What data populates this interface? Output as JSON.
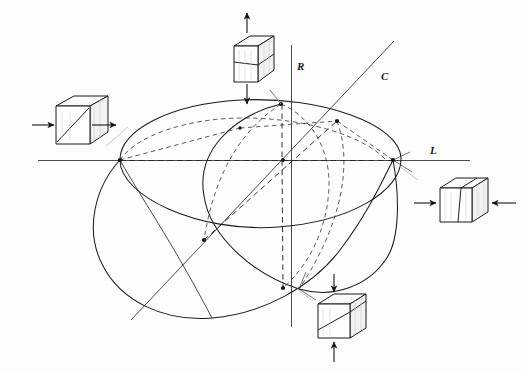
{
  "figure": {
    "background_color": "#fdfdfd",
    "ink_color": "#1b1b1b",
    "width": 521,
    "height": 372
  },
  "axes": [
    {
      "id": "R",
      "label": "R",
      "orientation": "vertical",
      "label_x": 297,
      "label_y": 66,
      "x1": 291,
      "y1": 45,
      "x2": 291,
      "y2": 327
    },
    {
      "id": "L",
      "label": "L",
      "orientation": "horizontal",
      "label_x": 432,
      "label_y": 152,
      "x1": 38,
      "y1": 160,
      "x2": 470,
      "y2": 160
    },
    {
      "id": "C",
      "label": "C",
      "orientation": "diagonal",
      "label_x": 383,
      "label_y": 78,
      "x1": 131,
      "y1": 320,
      "x2": 394,
      "y2": 41
    }
  ],
  "ellipsoid": {
    "center": {
      "x": 283,
      "y": 160
    },
    "sections": [
      {
        "name": "outline-ellipse",
        "style": "solid"
      },
      {
        "name": "front-great-circle",
        "style": "solid"
      },
      {
        "name": "lower-great-circle",
        "style": "solid"
      },
      {
        "name": "rear-great-circle",
        "style": "dashed"
      },
      {
        "name": "meridian-dashed",
        "style": "dashed"
      }
    ],
    "nodes": [
      {
        "name": "L-negative-pole",
        "x": 120,
        "y": 160
      },
      {
        "name": "L-positive-pole",
        "x": 393,
        "y": 160
      },
      {
        "name": "R-positive-pole",
        "x": 281,
        "y": 104
      },
      {
        "name": "R-negative-pole",
        "x": 283,
        "y": 288
      },
      {
        "name": "C-positive-pole",
        "x": 337,
        "y": 121
      },
      {
        "name": "C-negative-pole",
        "x": 204,
        "y": 240
      },
      {
        "name": "center",
        "x": 283,
        "y": 160
      }
    ]
  },
  "blocks": [
    {
      "id": "left-block",
      "data_name": "deformation-block-left",
      "position": {
        "x": 38,
        "y": 95
      },
      "marking": "diagonal-plane",
      "arrow_direction": "horizontal-outward",
      "stress_state": "extension",
      "linked_axis": "L",
      "leader": {
        "x1": 106,
        "y1": 146,
        "x2": 128,
        "y2": 127
      }
    },
    {
      "id": "top-block",
      "data_name": "deformation-block-top",
      "position": {
        "x": 228,
        "y": 33
      },
      "marking": "horizontal-plane",
      "arrow_direction": "vertical-outward",
      "stress_state": "extension",
      "linked_axis": "R",
      "leader": {
        "x1": 271,
        "y1": 88,
        "x2": 281,
        "y2": 104
      }
    },
    {
      "id": "right-block",
      "data_name": "deformation-block-right",
      "position": {
        "x": 432,
        "y": 178
      },
      "marking": "vertical-plane",
      "arrow_direction": "horizontal-inward",
      "stress_state": "compression",
      "linked_axis": "L",
      "leader": {
        "x1": 399,
        "y1": 168,
        "x2": 416,
        "y2": 181
      }
    },
    {
      "id": "bottom-block",
      "data_name": "deformation-block-bottom",
      "position": {
        "x": 312,
        "y": 294
      },
      "marking": "diagonal-plane",
      "arrow_direction": "vertical-inward",
      "stress_state": "compression",
      "linked_axis": "R",
      "leader": {
        "x1": 297,
        "y1": 288,
        "x2": 312,
        "y2": 300
      }
    }
  ]
}
